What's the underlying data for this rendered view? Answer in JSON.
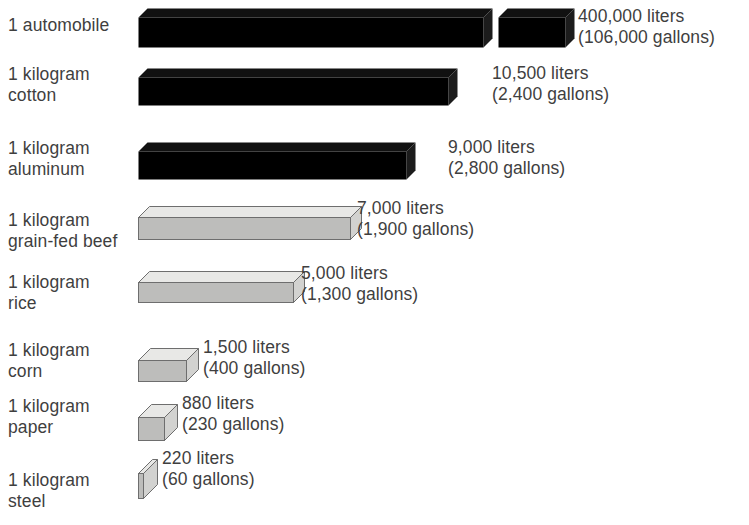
{
  "chart_data": {
    "type": "bar",
    "title": "",
    "subtitle": "",
    "xlabel": "",
    "ylabel": "",
    "orientation": "horizontal",
    "axis_note": "broken axis on top bar",
    "grid": false,
    "legend": "none",
    "categories": [
      "1 automobile",
      "1 kilogram cotton",
      "1 kilogram aluminum",
      "1 kilogram grain-fed beef",
      "1 kilogram rice",
      "1 kilogram corn",
      "1 kilogram paper",
      "1 kilogram steel"
    ],
    "values_liters": [
      400000,
      10500,
      9000,
      7000,
      5000,
      1500,
      880,
      220
    ],
    "values_gallons": [
      106000,
      2400,
      2800,
      1900,
      1300,
      400,
      230,
      60
    ],
    "unit_primary": "liters",
    "unit_secondary": "gallons"
  },
  "rows": [
    {
      "label_line1": "1 automobile",
      "label_line2": "",
      "value_line1": "400,000 liters",
      "value_line2": "(106,000 gallons)",
      "liters": 400000,
      "gallons": 106000,
      "style": "dark",
      "broken": true
    },
    {
      "label_line1": "1 kilogram",
      "label_line2": "cotton",
      "value_line1": "10,500 liters",
      "value_line2": "(2,400 gallons)",
      "liters": 10500,
      "gallons": 2400,
      "style": "dark",
      "broken": false
    },
    {
      "label_line1": "1 kilogram",
      "label_line2": "aluminum",
      "value_line1": "9,000 liters",
      "value_line2": "(2,800 gallons)",
      "liters": 9000,
      "gallons": 2800,
      "style": "dark",
      "broken": false
    },
    {
      "label_line1": "1 kilogram",
      "label_line2": "grain-fed beef",
      "value_line1": "7,000 liters",
      "value_line2": "(1,900 gallons)",
      "liters": 7000,
      "gallons": 1900,
      "style": "light",
      "broken": false
    },
    {
      "label_line1": "1 kilogram",
      "label_line2": "rice",
      "value_line1": "5,000 liters",
      "value_line2": "(1,300 gallons)",
      "liters": 5000,
      "gallons": 1300,
      "style": "light",
      "broken": false
    },
    {
      "label_line1": "1 kilogram",
      "label_line2": "corn",
      "value_line1": "1,500 liters",
      "value_line2": "(400 gallons)",
      "liters": 1500,
      "gallons": 400,
      "style": "light",
      "broken": false
    },
    {
      "label_line1": "1 kilogram",
      "label_line2": "paper",
      "value_line1": "880 liters",
      "value_line2": "(230 gallons)",
      "liters": 880,
      "gallons": 230,
      "style": "light",
      "broken": false
    },
    {
      "label_line1": "1 kilogram",
      "label_line2": "steel",
      "value_line1": "220 liters",
      "value_line2": "(60 gallons)",
      "liters": 220,
      "gallons": 60,
      "style": "light",
      "broken": false
    }
  ],
  "colors": {
    "background": "#ffffff",
    "text": "#3f3f3f",
    "bar_dark_top": "#111111",
    "bar_dark_front": "#000000",
    "bar_dark_side": "#1c1c1c",
    "bar_light_top": "#e8e8e6",
    "bar_light_front": "#bdbdbb",
    "bar_light_side": "#d2d2d0",
    "bar_outline": "#6e6e6e"
  }
}
